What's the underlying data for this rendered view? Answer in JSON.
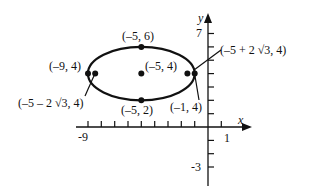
{
  "figure": {
    "type": "ellipse-graph",
    "axes": {
      "x_label": "x",
      "y_label": "y",
      "x_ticks_labeled": [
        "-9",
        "1"
      ],
      "y_ticks_labeled": [
        "7",
        "-3"
      ],
      "x_range": [
        -9,
        1
      ],
      "y_range": [
        -3,
        7
      ]
    },
    "ellipse": {
      "center": [
        -5,
        4
      ],
      "semi_major": 4,
      "semi_minor": 2,
      "orientation": "horizontal"
    },
    "points": [
      {
        "id": "top",
        "coords": [
          -5,
          6
        ],
        "label": "(–5, 6)"
      },
      {
        "id": "center",
        "coords": [
          -5,
          4
        ],
        "label": "(–5, 4)"
      },
      {
        "id": "bottom",
        "coords": [
          -5,
          2
        ],
        "label": "(–5, 2)"
      },
      {
        "id": "left-vertex",
        "coords": [
          -9,
          4
        ],
        "label": "(–9, 4)"
      },
      {
        "id": "right-vertex",
        "coords": [
          -1,
          4
        ],
        "label": "(–1, 4)"
      },
      {
        "id": "left-focus",
        "coords": [
          -8.46,
          4
        ],
        "label": "(–5 – 2 √3, 4)"
      },
      {
        "id": "right-focus",
        "coords": [
          -1.54,
          4
        ],
        "label": "(–5 + 2 √3, 4)"
      }
    ]
  }
}
